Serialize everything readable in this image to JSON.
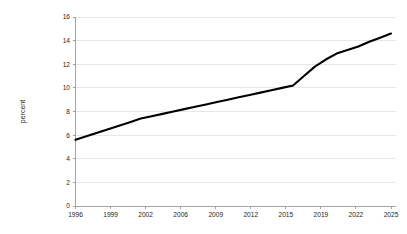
{
  "chart_data": {
    "type": "line",
    "title": "",
    "xlabel": "",
    "ylabel": "percent",
    "ylim": [
      0,
      16
    ],
    "yticks": [
      0,
      2,
      4,
      6,
      8,
      10,
      12,
      14,
      16
    ],
    "ytick_labels": [
      "0",
      "2",
      "4",
      "6",
      "8",
      "10",
      "12",
      "14",
      "16"
    ],
    "xtick_labels": [
      "1996",
      "1999",
      "2002",
      "2006",
      "2009",
      "2012",
      "2015",
      "2019",
      "2022",
      "2025"
    ],
    "grid": "horizontal",
    "legend": "none",
    "line_color": "#000000",
    "grid_color": "#dcdcdc",
    "axis_color": "#9a9a9a",
    "background_color": "#ffffff",
    "series": [
      {
        "name": "percent",
        "x": [
          1996,
          1997,
          1998,
          1999,
          2000,
          2001,
          2002,
          2003,
          2004,
          2005,
          2006,
          2007,
          2008,
          2009,
          2010,
          2011,
          2012,
          2013,
          2014,
          2015,
          2016,
          2017,
          2018,
          2019,
          2020,
          2021,
          2022,
          2023,
          2024,
          2025
        ],
        "values": [
          5.6,
          5.9,
          6.2,
          6.5,
          6.8,
          7.1,
          7.4,
          7.6,
          7.8,
          8.0,
          8.2,
          8.4,
          8.6,
          8.8,
          9.0,
          9.2,
          9.4,
          9.6,
          9.8,
          10.0,
          10.2,
          11.0,
          11.8,
          12.4,
          12.9,
          13.2,
          13.5,
          13.9,
          14.25,
          14.6
        ]
      }
    ]
  }
}
